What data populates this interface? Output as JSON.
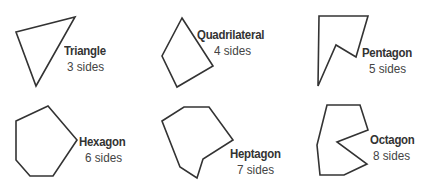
{
  "shapes": [
    {
      "name": "Triangle",
      "sides": "3 sides",
      "points": "16,32 75,17 36,86",
      "name_pos": [
        64,
        44
      ],
      "sides_pos": [
        67,
        60
      ]
    },
    {
      "name": "Quadrilateral",
      "sides": "4 sides",
      "points": "182,18 213,66 177,87 162,56",
      "name_pos": [
        197,
        28
      ],
      "sides_pos": [
        214,
        44
      ]
    },
    {
      "name": "Pentagon",
      "sides": "5 sides",
      "points": "319,16 368,16 356,57 336,45 318,86",
      "name_pos": [
        362,
        46
      ],
      "sides_pos": [
        369,
        62
      ]
    },
    {
      "name": "Hexagon",
      "sides": "6 sides",
      "points": "16,121 48,106 77,140 53,176 30,176 16,160",
      "name_pos": [
        79,
        135
      ],
      "sides_pos": [
        85,
        151
      ]
    },
    {
      "name": "Heptagon",
      "sides": "7 sides",
      "points": "162,121 184,107 209,107 233,140 203,159 197,178 180,167",
      "name_pos": [
        230,
        147
      ],
      "sides_pos": [
        237,
        163
      ]
    },
    {
      "name": "Octagon",
      "sides": "8 sides",
      "points": "327,105 360,105 368,130 337,142 367,164 344,175 320,175 317,145",
      "name_pos": [
        370,
        133
      ],
      "sides_pos": [
        373,
        149
      ]
    }
  ],
  "colors": {
    "stroke": "#333333",
    "text": "#333333"
  }
}
